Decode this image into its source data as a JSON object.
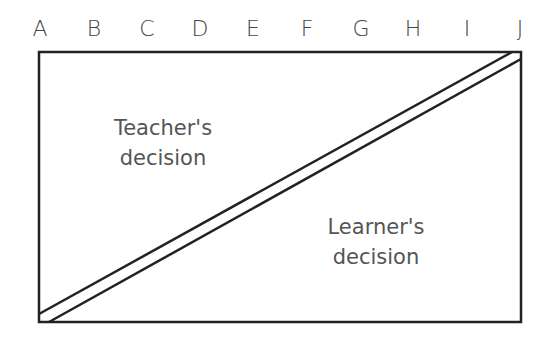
{
  "columns": [
    "A",
    "B",
    "C",
    "D",
    "E",
    "F",
    "G",
    "H",
    "I",
    "J"
  ],
  "regions": {
    "upper_left": {
      "line1": "Teacher's",
      "line2": "decision"
    },
    "lower_right": {
      "line1": "Learner's",
      "line2": "decision"
    }
  },
  "colors": {
    "line": "#222222",
    "text": "#555555"
  }
}
